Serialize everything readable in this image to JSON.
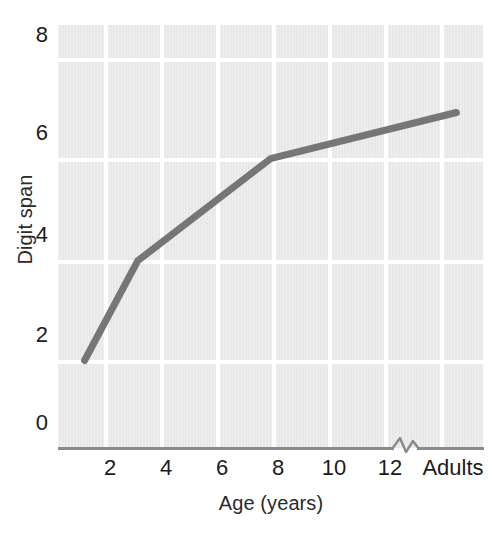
{
  "chart_data": {
    "type": "line",
    "title": "",
    "xlabel": "Age (years)",
    "ylabel": "Digit span",
    "grid": true,
    "legend": "none",
    "x_tick_labels": [
      "2",
      "4",
      "6",
      "8",
      "10",
      "12",
      "Adults"
    ],
    "x_tick_values": [
      2,
      4,
      6,
      8,
      10,
      12,
      16
    ],
    "x_axis_break": true,
    "xlim": [
      1,
      17
    ],
    "y_tick_labels": [
      "0",
      "2",
      "4",
      "6",
      "8"
    ],
    "y_tick_values": [
      0,
      2,
      4,
      6,
      8
    ],
    "ylim": [
      0,
      8.7
    ],
    "series": [
      {
        "name": "Digit span",
        "color": "#767676",
        "line_width": 7,
        "x": [
          2,
          4,
          9,
          16
        ],
        "x_labels": [
          "2",
          "4",
          "9",
          "Adults"
        ],
        "values": [
          1.8,
          3.85,
          5.95,
          6.9
        ]
      }
    ]
  },
  "axes": {
    "y_title": "Digit span",
    "x_title": "Age (years)",
    "y_ticks": [
      {
        "label": "8",
        "value": 8
      },
      {
        "label": "6",
        "value": 6
      },
      {
        "label": "4",
        "value": 4
      },
      {
        "label": "2",
        "value": 2
      },
      {
        "label": "0",
        "value": 0
      }
    ],
    "x_ticks": [
      {
        "label": "2",
        "value": 2
      },
      {
        "label": "4",
        "value": 4
      },
      {
        "label": "6",
        "value": 6
      },
      {
        "label": "8",
        "value": 8
      },
      {
        "label": "10",
        "value": 10
      },
      {
        "label": "12",
        "value": 12
      },
      {
        "label": "Adults",
        "value": 16
      }
    ]
  },
  "style": {
    "plot_background": "#e8e8e8",
    "gridline_color": "#ffffff",
    "line_color": "#767676",
    "axis_color": "#8a8a8a",
    "text_color": "#1b1b1b",
    "page_background": "#ffffff"
  }
}
